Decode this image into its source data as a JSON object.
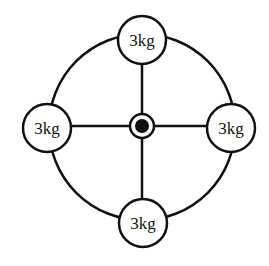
{
  "diagram": {
    "masses": [
      {
        "position": "top",
        "label": "3kg"
      },
      {
        "position": "left",
        "label": "3kg"
      },
      {
        "position": "right",
        "label": "3kg"
      },
      {
        "position": "bottom",
        "label": "3kg"
      }
    ],
    "colors": {
      "stroke": "#111111",
      "fill": "#ffffff"
    }
  }
}
